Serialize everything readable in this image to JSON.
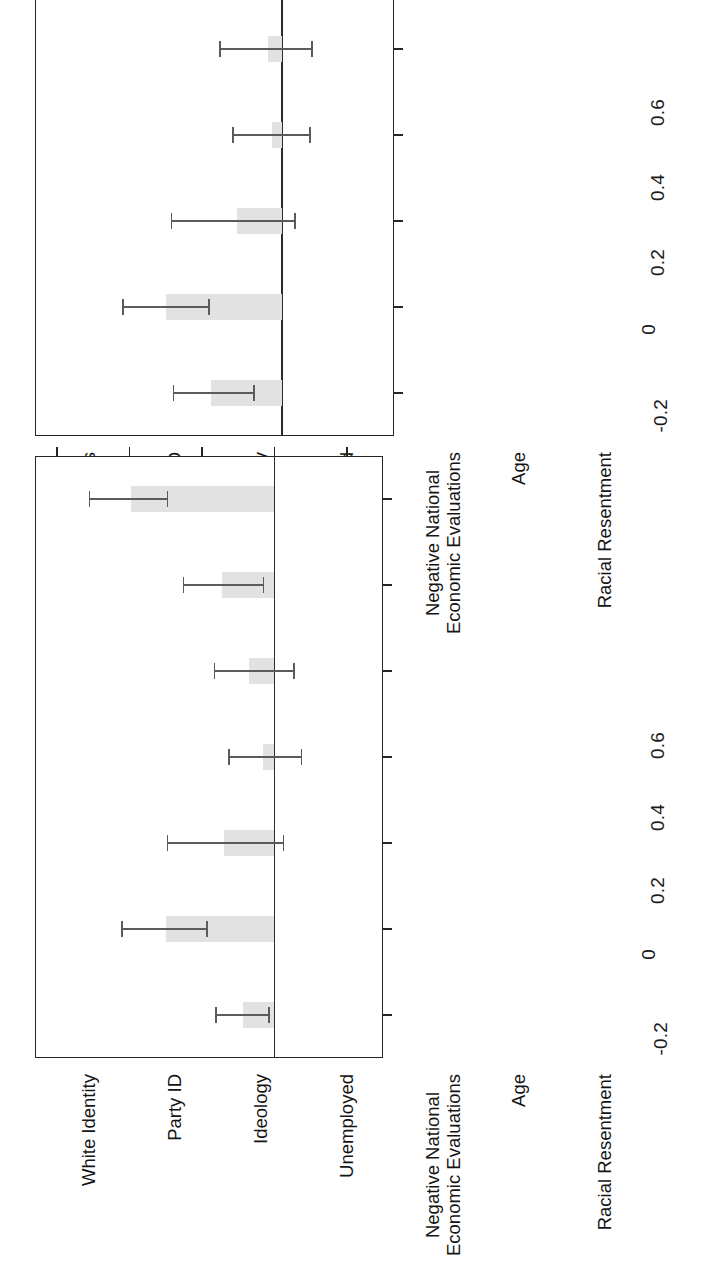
{
  "figure": {
    "orientation": "rotated-90-clockwise",
    "background": "#ffffff",
    "bar_fill": "#e2e2e2",
    "axis_color": "#262626",
    "error_bar_color": "#5b5b5b"
  },
  "chart_data": [
    {
      "panel_id": "top",
      "type": "bar",
      "title": "",
      "subtitle": "",
      "xlabel": "",
      "ylabel": "",
      "grid": false,
      "legend": "none",
      "ylim": [
        -0.3,
        0.66
      ],
      "yticks": [
        -0.2,
        0,
        0.2,
        0.4,
        0.6
      ],
      "ytick_labels": [
        "-0.2",
        "0",
        "0.2",
        "0.4",
        "0.6"
      ],
      "categories": [
        "White Consciousness",
        "Party ID",
        "Ideology",
        "Unemployed",
        "Negative National\nEconomic Evaluations",
        "Age",
        "Racial Resentment"
      ],
      "values": [
        0.19,
        0.31,
        0.12,
        0.025,
        0.037,
        0.135,
        0.355
      ],
      "ci_low": [
        0.075,
        0.195,
        -0.035,
        -0.075,
        -0.08,
        0.02,
        0.235
      ],
      "ci_high": [
        0.29,
        0.425,
        0.295,
        0.13,
        0.165,
        0.245,
        0.465
      ]
    },
    {
      "panel_id": "bottom",
      "type": "bar",
      "title": "",
      "subtitle": "",
      "xlabel": "",
      "ylabel": "",
      "grid": false,
      "legend": "none",
      "ylim": [
        -0.3,
        0.66
      ],
      "yticks": [
        -0.2,
        0,
        0.2,
        0.4,
        0.6
      ],
      "ytick_labels": [
        "-0.2",
        "0",
        "0.2",
        "0.4",
        "0.6"
      ],
      "categories": [
        "White Identity",
        "Party ID",
        "Ideology",
        "Unemployed",
        "Negative National\nEconomic Evaluations",
        "Age",
        "Racial Resentment"
      ],
      "values": [
        0.085,
        0.3,
        0.14,
        0.03,
        0.07,
        0.145,
        0.395
      ],
      "ci_low": [
        0.015,
        0.185,
        -0.025,
        -0.075,
        -0.055,
        0.03,
        0.295
      ],
      "ci_high": [
        0.16,
        0.42,
        0.295,
        0.125,
        0.165,
        0.25,
        0.51
      ]
    }
  ]
}
